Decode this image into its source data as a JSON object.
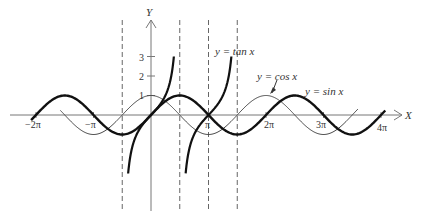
{
  "chart_data": {
    "type": "line",
    "title": "",
    "xlabel": "X",
    "ylabel": "Y",
    "xlim": [
      -6.6,
      12.9
    ],
    "ylim": [
      -3.0,
      3.0
    ],
    "grid": false,
    "legend": "inline annotations",
    "x_ticks": [
      {
        "value": -6.2832,
        "label": "−2π"
      },
      {
        "value": -3.1416,
        "label": "−π"
      },
      {
        "value": 3.1416,
        "label": "π"
      },
      {
        "value": 6.2832,
        "label": "2π"
      },
      {
        "value": 9.4248,
        "label": "3π"
      },
      {
        "value": 12.5664,
        "label": "4π"
      }
    ],
    "y_ticks": [
      {
        "value": 1,
        "label": "1"
      },
      {
        "value": 2,
        "label": "2"
      },
      {
        "value": 3,
        "label": "3"
      }
    ],
    "asymptotes_x": [
      -1.5708,
      1.5708,
      3.1416,
      4.7124
    ],
    "series": [
      {
        "name": "y = sin x",
        "function": "sin",
        "style": "thick",
        "x_range": [
          -6.55,
          12.8
        ]
      },
      {
        "name": "y = cos x",
        "function": "cos",
        "style": "thin",
        "x_range": [
          -4.95,
          11.3
        ]
      },
      {
        "name": "y = tan x",
        "function": "tan",
        "style": "thick",
        "branches": [
          [
            -1.249,
            1.249
          ],
          [
            1.893,
            4.391
          ]
        ],
        "y_clip": [
          -3,
          3
        ]
      }
    ],
    "annotations": [
      {
        "text": "y = tan x",
        "near": "right tan branch top"
      },
      {
        "text": "y = cos x",
        "near": "cos peak at 2π",
        "arrow": true
      },
      {
        "text": "y = sin x",
        "near": "sin peak at 5π/2"
      }
    ]
  },
  "labels": {
    "y_axis": "Y",
    "x_axis": "X",
    "tan": "y = tan x",
    "cos": "y = cos x",
    "sin": "y = sin x",
    "tick_m2pi": "−2π",
    "tick_mpi": "−π",
    "tick_pi": "π",
    "tick_2pi": "2π",
    "tick_3pi": "3π",
    "tick_4pi": "4π",
    "tick_1": "1",
    "tick_2": "2",
    "tick_3": "3"
  }
}
